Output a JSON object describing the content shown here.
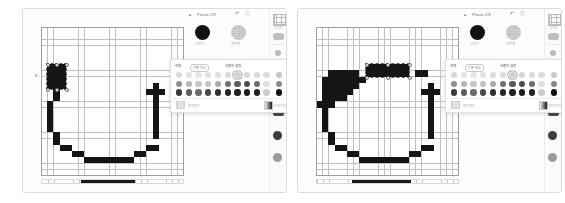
{
  "figure": {
    "panel_count": 2,
    "caption": ""
  },
  "app": {
    "toolbar": {
      "caret_icon": "chevron-up-icon",
      "title": "Phase 2/3",
      "undo_icon": "undo-icon",
      "help_icon": "help-icon"
    },
    "brushes": [
      {
        "name": "solid-brush",
        "label": "그리기",
        "style": "solid"
      },
      {
        "name": "texture-brush",
        "label": "지우개",
        "style": "dots"
      }
    ],
    "rail": {
      "items": [
        {
          "name": "grid-tool",
          "icon": "grid-icon",
          "label": "그리드"
        },
        {
          "name": "shape-tool",
          "icon": "shape-icon",
          "label": ""
        },
        {
          "name": "small-dot-tool",
          "icon": "dot-small-icon",
          "label": ""
        },
        {
          "name": "mid-dot-tool",
          "icon": "dot-mid-icon",
          "label": ""
        },
        {
          "name": "large-dot-tool",
          "icon": "dot-large-icon",
          "label": "크기"
        },
        {
          "name": "gradient-tool",
          "icon": "gradient-icon",
          "label": ""
        },
        {
          "name": "brush-tool",
          "icon": "brush-icon",
          "label": ""
        },
        {
          "name": "eraser-tool",
          "icon": "eraser-icon",
          "label": ""
        },
        {
          "name": "smudge-tool",
          "icon": "smudge-icon",
          "label": ""
        }
      ]
    },
    "palette": {
      "label": "색채",
      "tab_selected": "기본 색상",
      "tab_other": "사용자 설정",
      "rows": 3,
      "columns": 11,
      "selected_index": 6,
      "swatch_rows": [
        [
          "#d9d9d9",
          "#e3e3e3",
          "#e6e6e6",
          "#e2e2e2",
          "#dedede",
          "#dcdcdc",
          "#d2d2d2",
          "#d8d8d8",
          "#dbdbdb",
          "#dddddd",
          "#c9c9c9"
        ],
        [
          "#8f8f8f",
          "#b5b5b5",
          "#c6c6c6",
          "#c2c2c2",
          "#a8a8a8",
          "#6f6f6f",
          "#5a5a5a",
          "#4e4e4e",
          "#6b6b6b",
          "#e0e0e0",
          "#8a8a8a"
        ],
        [
          "#3a3a3a",
          "#5c5c5c",
          "#6a6a6a",
          "#4a4a4a",
          "#2f2f2f",
          "#262626",
          "#1f1f1f",
          "#1b1b1b",
          "#242424",
          "#cfcfcf",
          "#111111"
        ]
      ],
      "opacity_label": "불투명도",
      "gradient_label": "그라데이션"
    },
    "status_ruler": {
      "value_label": ""
    }
  },
  "panels": [
    {
      "name": "panel-left",
      "grid": {
        "cols": 23,
        "rows": 24
      },
      "selection": {
        "x": 1,
        "y": 6,
        "w": 3,
        "h": 4
      },
      "cursor_marker": "c",
      "pixels": [
        [
          1,
          6
        ],
        [
          2,
          6
        ],
        [
          3,
          6
        ],
        [
          1,
          7
        ],
        [
          2,
          7
        ],
        [
          3,
          7
        ],
        [
          1,
          8
        ],
        [
          2,
          8
        ],
        [
          3,
          8
        ],
        [
          1,
          9
        ],
        [
          2,
          9
        ],
        [
          3,
          9
        ],
        [
          2,
          10
        ],
        [
          2,
          11
        ],
        [
          1,
          12
        ],
        [
          1,
          13
        ],
        [
          1,
          14
        ],
        [
          1,
          15
        ],
        [
          1,
          16
        ],
        [
          2,
          17
        ],
        [
          2,
          18
        ],
        [
          3,
          19
        ],
        [
          4,
          19
        ],
        [
          5,
          20
        ],
        [
          6,
          20
        ],
        [
          7,
          21
        ],
        [
          8,
          21
        ],
        [
          9,
          21
        ],
        [
          10,
          21
        ],
        [
          11,
          21
        ],
        [
          12,
          21
        ],
        [
          13,
          21
        ],
        [
          14,
          21
        ],
        [
          15,
          20
        ],
        [
          16,
          20
        ],
        [
          17,
          19
        ],
        [
          18,
          19
        ],
        [
          18,
          17
        ],
        [
          18,
          16
        ],
        [
          18,
          15
        ],
        [
          18,
          14
        ],
        [
          18,
          13
        ],
        [
          18,
          12
        ],
        [
          18,
          11
        ],
        [
          17,
          10
        ],
        [
          18,
          10
        ],
        [
          19,
          10
        ],
        [
          18,
          9
        ]
      ],
      "ruler": {
        "fill_start_pct": 28,
        "fill_width_pct": 38
      }
    },
    {
      "name": "panel-right",
      "grid": {
        "cols": 23,
        "rows": 24
      },
      "selection": {
        "x": 8,
        "y": 6,
        "w": 7,
        "h": 2
      },
      "cursor_marker": "",
      "pixels": [
        [
          2,
          7
        ],
        [
          3,
          7
        ],
        [
          4,
          7
        ],
        [
          5,
          7
        ],
        [
          6,
          7
        ],
        [
          1,
          8
        ],
        [
          2,
          8
        ],
        [
          3,
          8
        ],
        [
          4,
          8
        ],
        [
          5,
          8
        ],
        [
          6,
          8
        ],
        [
          7,
          8
        ],
        [
          1,
          9
        ],
        [
          2,
          9
        ],
        [
          3,
          9
        ],
        [
          4,
          9
        ],
        [
          5,
          9
        ],
        [
          6,
          9
        ],
        [
          1,
          10
        ],
        [
          2,
          10
        ],
        [
          3,
          10
        ],
        [
          4,
          10
        ],
        [
          5,
          10
        ],
        [
          1,
          11
        ],
        [
          2,
          11
        ],
        [
          3,
          11
        ],
        [
          4,
          11
        ],
        [
          0,
          12
        ],
        [
          1,
          12
        ],
        [
          2,
          12
        ],
        [
          8,
          6
        ],
        [
          9,
          6
        ],
        [
          10,
          6
        ],
        [
          11,
          6
        ],
        [
          12,
          6
        ],
        [
          13,
          6
        ],
        [
          14,
          6
        ],
        [
          8,
          7
        ],
        [
          9,
          7
        ],
        [
          10,
          7
        ],
        [
          11,
          7
        ],
        [
          12,
          7
        ],
        [
          13,
          7
        ],
        [
          14,
          7
        ],
        [
          16,
          7
        ],
        [
          17,
          7
        ],
        [
          1,
          13
        ],
        [
          1,
          14
        ],
        [
          1,
          15
        ],
        [
          1,
          16
        ],
        [
          2,
          17
        ],
        [
          2,
          18
        ],
        [
          3,
          19
        ],
        [
          4,
          19
        ],
        [
          5,
          20
        ],
        [
          6,
          20
        ],
        [
          7,
          21
        ],
        [
          8,
          21
        ],
        [
          9,
          21
        ],
        [
          10,
          21
        ],
        [
          11,
          21
        ],
        [
          12,
          21
        ],
        [
          13,
          21
        ],
        [
          14,
          21
        ],
        [
          15,
          20
        ],
        [
          16,
          20
        ],
        [
          17,
          19
        ],
        [
          18,
          19
        ],
        [
          18,
          17
        ],
        [
          18,
          16
        ],
        [
          18,
          15
        ],
        [
          18,
          14
        ],
        [
          18,
          13
        ],
        [
          18,
          12
        ],
        [
          18,
          11
        ],
        [
          17,
          10
        ],
        [
          18,
          10
        ],
        [
          19,
          10
        ],
        [
          18,
          9
        ]
      ],
      "ruler": {
        "fill_start_pct": 25,
        "fill_width_pct": 42
      }
    }
  ]
}
